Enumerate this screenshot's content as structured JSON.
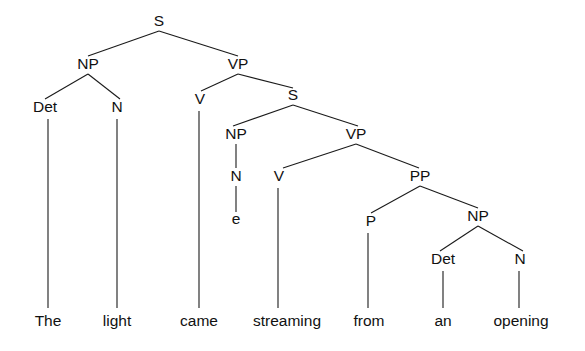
{
  "figure": {
    "kind": "constituency-syntax-tree",
    "sentence": "The light came streaming from an opening",
    "background_color": "#ffffff",
    "line_color": "#1a1a1a",
    "text_color": "#111111"
  },
  "nodes": [
    {
      "id": "S1",
      "label": "S",
      "x": 159,
      "y": 26
    },
    {
      "id": "NP1",
      "label": "NP",
      "x": 88,
      "y": 69
    },
    {
      "id": "VP1",
      "label": "VP",
      "x": 238,
      "y": 69
    },
    {
      "id": "Det1",
      "label": "Det",
      "x": 45,
      "y": 112
    },
    {
      "id": "N1",
      "label": "N",
      "x": 117,
      "y": 112
    },
    {
      "id": "V1",
      "label": "V",
      "x": 200,
      "y": 104
    },
    {
      "id": "S2",
      "label": "S",
      "x": 293,
      "y": 100
    },
    {
      "id": "NP2",
      "label": "NP",
      "x": 236,
      "y": 139
    },
    {
      "id": "VP2",
      "label": "VP",
      "x": 356,
      "y": 139
    },
    {
      "id": "N2",
      "label": "N",
      "x": 236,
      "y": 181
    },
    {
      "id": "V2",
      "label": "V",
      "x": 279,
      "y": 181
    },
    {
      "id": "PP1",
      "label": "PP",
      "x": 420,
      "y": 181
    },
    {
      "id": "P1",
      "label": "P",
      "x": 371,
      "y": 226
    },
    {
      "id": "NP3",
      "label": "NP",
      "x": 478,
      "y": 221
    },
    {
      "id": "Det2",
      "label": "Det",
      "x": 443,
      "y": 264
    },
    {
      "id": "N3",
      "label": "N",
      "x": 520,
      "y": 264
    },
    {
      "id": "trace_e",
      "label": "e",
      "x": 236,
      "y": 224
    }
  ],
  "leaves": [
    {
      "id": "w1",
      "label": "The",
      "x": 48,
      "y": 326
    },
    {
      "id": "w2",
      "label": "light",
      "x": 117,
      "y": 326
    },
    {
      "id": "w3",
      "label": "came",
      "x": 199,
      "y": 326
    },
    {
      "id": "w4",
      "label": "streaming",
      "x": 287,
      "y": 326
    },
    {
      "id": "w5",
      "label": "from",
      "x": 369,
      "y": 326
    },
    {
      "id": "w6",
      "label": "an",
      "x": 443,
      "y": 326
    },
    {
      "id": "w7",
      "label": "opening",
      "x": 521,
      "y": 326
    }
  ],
  "edges": [
    {
      "from": "S1",
      "to": "NP1",
      "x1": 159,
      "y1": 31,
      "x2": 88,
      "y2": 56
    },
    {
      "from": "S1",
      "to": "VP1",
      "x1": 159,
      "y1": 31,
      "x2": 238,
      "y2": 56
    },
    {
      "from": "NP1",
      "to": "Det1",
      "x1": 88,
      "y1": 74,
      "x2": 45,
      "y2": 99
    },
    {
      "from": "NP1",
      "to": "N1",
      "x1": 88,
      "y1": 74,
      "x2": 120,
      "y2": 99
    },
    {
      "from": "VP1",
      "to": "V1",
      "x1": 238,
      "y1": 74,
      "x2": 201,
      "y2": 91
    },
    {
      "from": "VP1",
      "to": "S2",
      "x1": 238,
      "y1": 74,
      "x2": 293,
      "y2": 88
    },
    {
      "from": "S2",
      "to": "NP2",
      "x1": 293,
      "y1": 105,
      "x2": 233,
      "y2": 126
    },
    {
      "from": "S2",
      "to": "VP2",
      "x1": 293,
      "y1": 105,
      "x2": 358,
      "y2": 126
    },
    {
      "from": "NP2",
      "to": "N2",
      "x1": 236,
      "y1": 144,
      "x2": 236,
      "y2": 168
    },
    {
      "from": "N2",
      "to": "trace_e",
      "x1": 236,
      "y1": 186,
      "x2": 236,
      "y2": 212
    },
    {
      "from": "VP2",
      "to": "V2",
      "x1": 356,
      "y1": 144,
      "x2": 283,
      "y2": 168
    },
    {
      "from": "VP2",
      "to": "PP1",
      "x1": 356,
      "y1": 144,
      "x2": 419,
      "y2": 168
    },
    {
      "from": "PP1",
      "to": "P1",
      "x1": 420,
      "y1": 186,
      "x2": 371,
      "y2": 213
    },
    {
      "from": "PP1",
      "to": "NP3",
      "x1": 420,
      "y1": 186,
      "x2": 478,
      "y2": 208
    },
    {
      "from": "NP3",
      "to": "Det2",
      "x1": 478,
      "y1": 226,
      "x2": 440,
      "y2": 251
    },
    {
      "from": "NP3",
      "to": "N3",
      "x1": 478,
      "y1": 226,
      "x2": 523,
      "y2": 251
    },
    {
      "from": "Det1",
      "to": "w1",
      "x1": 48,
      "y1": 119,
      "x2": 48,
      "y2": 308
    },
    {
      "from": "N1",
      "to": "w2",
      "x1": 117,
      "y1": 119,
      "x2": 117,
      "y2": 308
    },
    {
      "from": "V1",
      "to": "w3",
      "x1": 199,
      "y1": 111,
      "x2": 199,
      "y2": 308
    },
    {
      "from": "V2",
      "to": "w4",
      "x1": 278,
      "y1": 188,
      "x2": 278,
      "y2": 308
    },
    {
      "from": "P1",
      "to": "w5",
      "x1": 368,
      "y1": 233,
      "x2": 368,
      "y2": 308
    },
    {
      "from": "Det2",
      "to": "w6",
      "x1": 443,
      "y1": 271,
      "x2": 443,
      "y2": 308
    },
    {
      "from": "N3",
      "to": "w7",
      "x1": 519,
      "y1": 271,
      "x2": 519,
      "y2": 308
    }
  ]
}
